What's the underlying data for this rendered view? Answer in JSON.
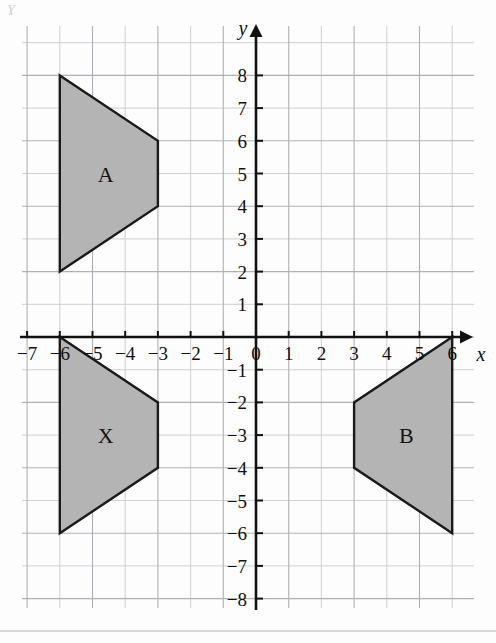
{
  "chart_data": {
    "type": "scatter",
    "title": "",
    "subtitle": "",
    "xlabel": "x",
    "ylabel": "y",
    "xlim": [
      -7.2,
      6.7
    ],
    "ylim": [
      -8.2,
      8.6
    ],
    "grid": true,
    "legend": null,
    "x_ticks": [
      -7,
      -6,
      -5,
      -4,
      -3,
      -2,
      -1,
      0,
      1,
      2,
      3,
      4,
      5,
      6
    ],
    "x_tick_labels": [
      "−7",
      "−6",
      "−5",
      "−4",
      "−3",
      "−2",
      "−1",
      "0",
      "1",
      "2",
      "3",
      "4",
      "5",
      "6"
    ],
    "y_ticks": [
      8,
      7,
      6,
      5,
      4,
      3,
      2,
      1,
      -1,
      -2,
      -3,
      -4,
      -5,
      -6,
      -7,
      -8
    ],
    "y_tick_labels": [
      "8",
      "7",
      "6",
      "5",
      "4",
      "3",
      "2",
      "1",
      "−1",
      "−2",
      "−3",
      "−4",
      "−5",
      "−6",
      "−7",
      "−8"
    ],
    "origin_label": "0",
    "shapes": [
      {
        "name": "A",
        "label": "A",
        "label_point": [
          -4.6,
          5.0
        ],
        "fill": "#b4b4b4",
        "stroke": "#1a1a1a",
        "vertices": [
          [
            -6,
            8
          ],
          [
            -3,
            6
          ],
          [
            -3,
            4
          ],
          [
            -6,
            2
          ]
        ]
      },
      {
        "name": "X",
        "label": "X",
        "label_point": [
          -4.6,
          -3.0
        ],
        "fill": "#b4b4b4",
        "stroke": "#1a1a1a",
        "vertices": [
          [
            -6,
            0
          ],
          [
            -3,
            -2
          ],
          [
            -3,
            -4
          ],
          [
            -6,
            -6
          ]
        ]
      },
      {
        "name": "B",
        "label": "B",
        "label_point": [
          4.6,
          -3.0
        ],
        "fill": "#b4b4b4",
        "stroke": "#1a1a1a",
        "vertices": [
          [
            6,
            0
          ],
          [
            3,
            -2
          ],
          [
            3,
            -4
          ],
          [
            6,
            -6
          ]
        ]
      }
    ],
    "colors": {
      "grid_minor": "#c9c9cf",
      "grid_major": "#b0b0b8",
      "axis": "#111111",
      "shape_fill": "#b4b4b4",
      "shape_stroke": "#1a1a1a",
      "tick_text": "#111111"
    },
    "geometry": {
      "origin_px": [
        256,
        337
      ],
      "unit_px": 32.7,
      "grid_left_px": 22,
      "grid_top_px": 26,
      "grid_right_px": 474,
      "grid_bottom_px": 608
    }
  },
  "artifacts": {
    "corner_smudge": "ɣ"
  }
}
